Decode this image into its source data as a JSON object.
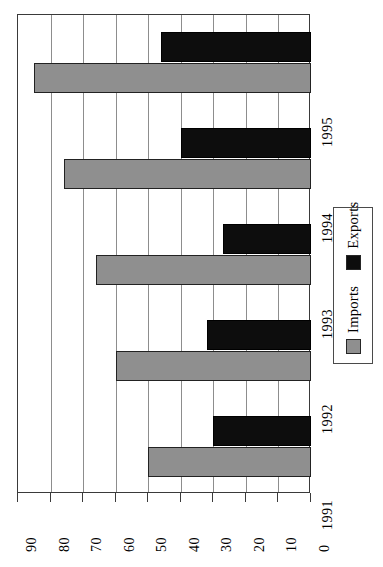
{
  "chart_data": {
    "type": "bar",
    "orientation": "horizontal",
    "title": "",
    "subtitle": "",
    "xlabel": "",
    "ylabel": "",
    "categories": [
      "1991",
      "1992",
      "1993",
      "1994",
      "1995"
    ],
    "series": [
      {
        "name": "Imports",
        "color": "#8f8f8f",
        "values": [
          50,
          60,
          66,
          76,
          85
        ]
      },
      {
        "name": "Exports",
        "color": "#0d0d0d",
        "values": [
          30,
          32,
          27,
          40,
          46
        ]
      }
    ],
    "value_ticks": [
      90,
      80,
      70,
      60,
      50,
      40,
      30,
      20,
      10,
      0
    ],
    "tick_labels": [
      "90",
      "80",
      "70",
      "60",
      "50",
      "40",
      "30",
      "20",
      "10",
      "0"
    ],
    "xlim": [
      0,
      90
    ],
    "value_axis_direction": "decreasing-left-to-right",
    "grid": true,
    "grid_axis": "value",
    "legend": {
      "position": "right",
      "entries": [
        {
          "label": "Imports",
          "color": "#8f8f8f"
        },
        {
          "label": "Exports",
          "color": "#0d0d0d"
        }
      ]
    },
    "frame": {
      "border_color": "#3a3a3a",
      "grid_color": "#8d8d8d",
      "background": "#ffffff"
    },
    "rotation_note": "chart drawn rotated 90 degrees; labels read bottom-up"
  }
}
